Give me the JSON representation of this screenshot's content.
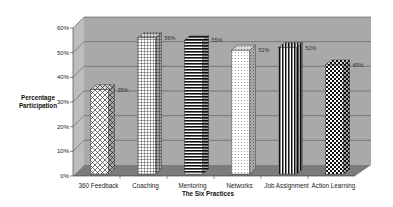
{
  "chart_data": {
    "type": "bar",
    "style": "3d-column",
    "title": "",
    "xlabel": "The Six Practices",
    "ylabel": "Percentage Participation",
    "ylim": [
      0,
      60
    ],
    "yticks": [
      "0%",
      "10%",
      "20%",
      "30%",
      "40%",
      "50%",
      "60%"
    ],
    "grid": true,
    "legend": "none",
    "categories": [
      "360 Feedback",
      "Coaching",
      "Mentoring",
      "Networks",
      "Job Assignment",
      "Action Learning"
    ],
    "values": [
      35,
      56,
      55,
      51,
      52,
      45
    ],
    "value_labels": [
      "35%",
      "56%",
      "55%",
      "51%",
      "52%",
      "45%"
    ],
    "patterns": [
      "diamond-crosshatch",
      "grid",
      "horizontal-stripes",
      "dots",
      "vertical-stripes",
      "checkerboard"
    ],
    "colors": {
      "wall": "#a9a9a9",
      "floor": "#7c7c7c",
      "side_wall": "#bdbdbd",
      "gridline": "#555555"
    }
  }
}
